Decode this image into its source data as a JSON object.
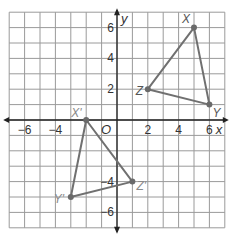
{
  "chart_data": {
    "type": "scatter",
    "title": "",
    "xlabel": "x",
    "ylabel": "y",
    "xlim": [
      -7,
      7
    ],
    "ylim": [
      -7,
      7
    ],
    "grid": true,
    "x_ticks": [
      -6,
      -4,
      2,
      4,
      6
    ],
    "y_ticks": [
      6,
      4,
      2,
      -4,
      -6
    ],
    "origin_label": "O",
    "series": [
      {
        "name": "Triangle XYZ",
        "points": [
          {
            "label": "X",
            "x": 5,
            "y": 6
          },
          {
            "label": "Y",
            "x": 6,
            "y": 1
          },
          {
            "label": "Z",
            "x": 2,
            "y": 2
          }
        ]
      },
      {
        "name": "Triangle X'Y'Z'",
        "points": [
          {
            "label": "X'",
            "x": -2,
            "y": 0
          },
          {
            "label": "Y'",
            "x": -3,
            "y": -5
          },
          {
            "label": "Z'",
            "x": 1,
            "y": -4
          }
        ]
      }
    ]
  },
  "colors": {
    "grid": "#9a9a9a",
    "axis": "#222222",
    "triangle": "#707070",
    "vertex": "#6a6a6a",
    "prime_label": "#8a8a8a",
    "label": "#555555"
  }
}
